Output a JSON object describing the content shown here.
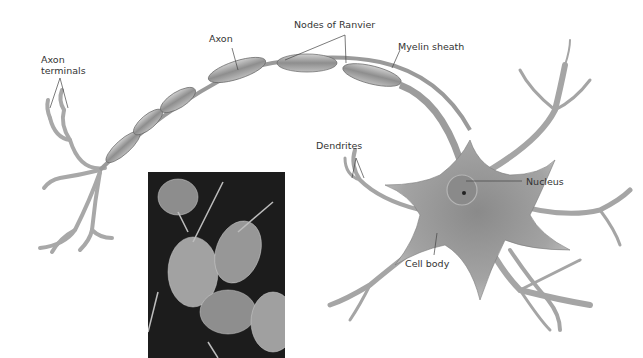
{
  "figure": {
    "labels": {
      "axon_terminals_line1": "Axon",
      "axon_terminals_line2": "terminals",
      "axon": "Axon",
      "nodes_of_ranvier": "Nodes of Ranvier",
      "myelin_sheath": "Myelin sheath",
      "dendrites": "Dendrites",
      "nucleus": "Nucleus",
      "cell_body": "Cell body"
    },
    "inset": {
      "description": "Scanning electron micrograph of neurons"
    },
    "colors": {
      "neuron_fill": "#9a9a9a",
      "neuron_dark": "#6f6f6f",
      "neuron_light": "#c8c8c8",
      "label_text": "#333333",
      "leader_line": "#444444",
      "micrograph_bg": "#1a1a1a"
    }
  }
}
